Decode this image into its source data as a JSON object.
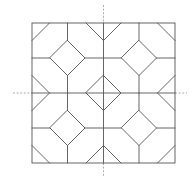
{
  "diagram": {
    "type": "geometric-tiling-pattern",
    "colors": {
      "line": "#555555",
      "axis": "#9a9a9a",
      "background": "#ffffff"
    },
    "frame": {
      "x": 32,
      "y": 23,
      "w": 143,
      "h": 140
    },
    "grid": {
      "xs": [
        32,
        67.5,
        103.5,
        139,
        175
      ],
      "ys": [
        23,
        58,
        93,
        128,
        163
      ]
    },
    "diamond_half": 17.5,
    "diamonds": [
      {
        "cx": 67.5,
        "cy": 58
      },
      {
        "cx": 139,
        "cy": 58
      },
      {
        "cx": 103.5,
        "cy": 93
      },
      {
        "cx": 67.5,
        "cy": 128
      },
      {
        "cx": 139,
        "cy": 128
      }
    ],
    "axes": {
      "vertical": {
        "x": 103.5,
        "y1": 5,
        "y2": 177
      },
      "horizontal": {
        "y": 93,
        "x1": 13,
        "x2": 187
      }
    }
  }
}
